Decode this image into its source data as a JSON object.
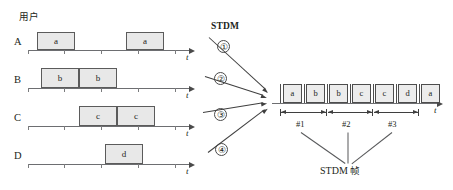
{
  "diagram": {
    "users_heading": "用户",
    "stdm_title": "STDM",
    "time_axis_label": "t",
    "frame_caption_prefix": "STDM ",
    "frame_caption_cjk": "帧",
    "colors": {
      "block_fill": "#e8e8e8",
      "block_stroke": "#5b5b5b",
      "axis": "#6d6e71",
      "arrow": "#3f3f3f",
      "text": "#231f20"
    }
  },
  "users": [
    {
      "name": "A",
      "circled_number": "①",
      "axis": {
        "x": 28,
        "y": 50,
        "width": 162,
        "ticks": [
          28,
          64,
          101,
          138,
          175
        ]
      },
      "blocks": [
        {
          "label": "a",
          "x": 37,
          "width": 38,
          "height": 18
        },
        {
          "label": "a",
          "x": 126,
          "width": 38,
          "height": 18
        }
      ]
    },
    {
      "name": "B",
      "circled_number": "②",
      "axis": {
        "x": 28,
        "y": 88,
        "width": 162,
        "ticks": [
          28,
          64,
          101,
          138,
          175
        ]
      },
      "blocks": [
        {
          "label": "b",
          "x": 41,
          "width": 38,
          "height": 20
        },
        {
          "label": "b",
          "x": 79,
          "width": 38,
          "height": 20
        }
      ]
    },
    {
      "name": "C",
      "circled_number": "③",
      "axis": {
        "x": 28,
        "y": 126,
        "width": 162,
        "ticks": [
          28,
          64,
          101,
          138,
          175
        ]
      },
      "blocks": [
        {
          "label": "c",
          "x": 79,
          "width": 38,
          "height": 20
        },
        {
          "label": "c",
          "x": 117,
          "width": 38,
          "height": 20
        }
      ]
    },
    {
      "name": "D",
      "circled_number": "④",
      "axis": {
        "x": 28,
        "y": 164,
        "width": 162,
        "ticks": [
          28,
          64,
          101,
          138,
          175
        ]
      },
      "blocks": [
        {
          "label": "d",
          "x": 105,
          "width": 38,
          "height": 20
        }
      ]
    }
  ],
  "output": {
    "axis": {
      "x": 272,
      "y": 103,
      "width": 166,
      "label": "t"
    },
    "cells": [
      {
        "label": "a"
      },
      {
        "label": "b"
      },
      {
        "label": "b"
      },
      {
        "label": "c"
      },
      {
        "label": "c"
      },
      {
        "label": "d"
      },
      {
        "label": "a"
      }
    ],
    "frames": [
      {
        "label": "#1"
      },
      {
        "label": "#2"
      },
      {
        "label": "#3"
      }
    ]
  }
}
